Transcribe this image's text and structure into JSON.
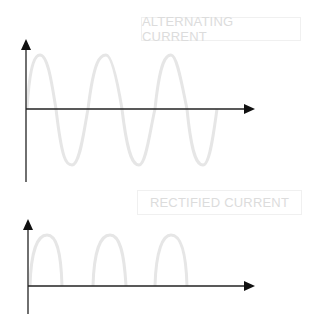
{
  "diagrams": [
    {
      "title": "ALTERNATING CURRENT",
      "waveform": "sine",
      "wave_color": "#e6e6e6",
      "axis_color": "#111111"
    },
    {
      "title": "RECTIFIED CURRENT",
      "waveform": "half-wave-rectified",
      "wave_color": "#e6e6e6",
      "axis_color": "#111111"
    }
  ]
}
